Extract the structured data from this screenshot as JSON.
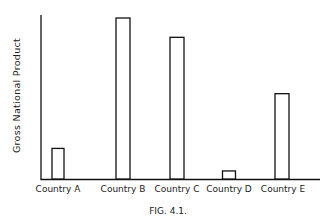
{
  "chart_data": {
    "type": "bar",
    "title": "",
    "caption": "FIG. 4.1.",
    "xlabel": "",
    "ylabel": "Gross National Product",
    "categories": [
      "Country A",
      "Country B",
      "Country C",
      "Country D",
      "Country E"
    ],
    "values": [
      19,
      100,
      88,
      5,
      53
    ],
    "value_units": "relative (no numeric scale shown; tallest bar = 100)",
    "ylim": [
      0,
      100
    ],
    "grid": false,
    "legend": null,
    "bar_style": "outlined, unfilled"
  },
  "figure": {
    "caption": "FIG. 4.1.",
    "ylabel": "Gross National Product",
    "labels": [
      "Country A",
      "Country B",
      "Country C",
      "Country D",
      "Country E"
    ]
  }
}
